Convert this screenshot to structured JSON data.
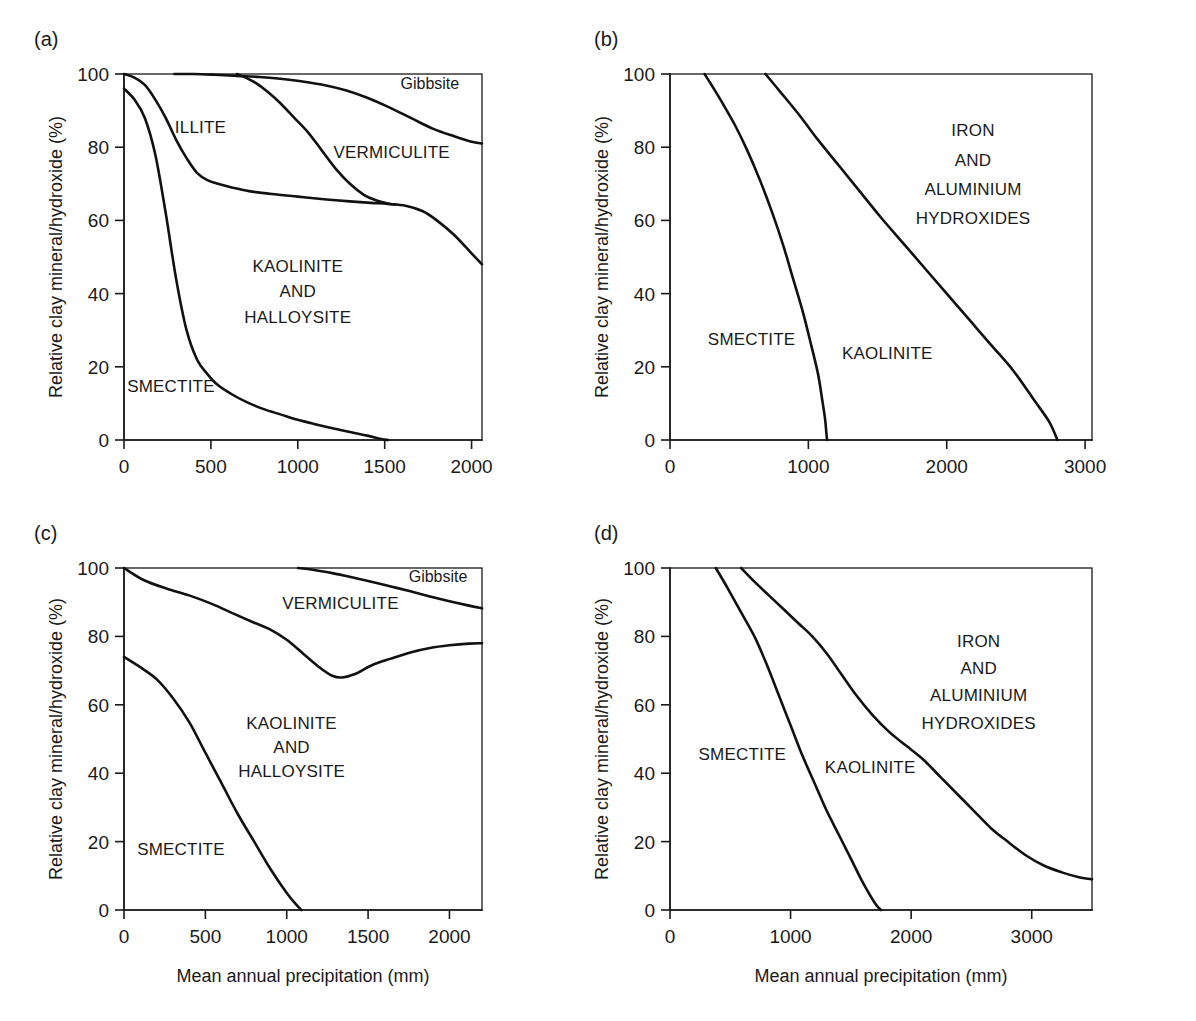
{
  "figure": {
    "y_axis_label": "Relative clay mineral/hydroxide (%)",
    "x_axis_label": "Mean annual precipitation (mm)"
  },
  "panels": [
    {
      "tag": "(a)",
      "name": "panel-a",
      "x_ticks": [
        0,
        500,
        1000,
        1500,
        2000
      ],
      "y_ticks": [
        0,
        20,
        40,
        60,
        80,
        100
      ],
      "xlim": [
        0,
        2060
      ],
      "ylim": [
        0,
        100
      ],
      "show_x_axis_title": false,
      "regions": [
        {
          "text": "ILLITE",
          "x": 440,
          "y": 84,
          "size": "normal"
        },
        {
          "text": "VERMICULITE",
          "x": 1540,
          "y": 77,
          "size": "normal"
        },
        {
          "text": "Gibbsite",
          "x": 1760,
          "y": 96,
          "size": "small"
        },
        {
          "text": "KAOLINITE",
          "x": 1000,
          "y": 46,
          "size": "normal"
        },
        {
          "text": "AND",
          "x": 1000,
          "y": 39,
          "size": "normal"
        },
        {
          "text": "HALLOYSITE",
          "x": 1000,
          "y": 32,
          "size": "normal"
        },
        {
          "text": "SMECTITE",
          "x": 270,
          "y": 13,
          "size": "normal"
        }
      ]
    },
    {
      "tag": "(b)",
      "name": "panel-b",
      "x_ticks": [
        0,
        1000,
        2000,
        3000
      ],
      "y_ticks": [
        0,
        20,
        40,
        60,
        80,
        100
      ],
      "xlim": [
        0,
        3050
      ],
      "ylim": [
        0,
        100
      ],
      "show_x_axis_title": false,
      "regions": [
        {
          "text": "IRON",
          "x": 2190,
          "y": 83,
          "size": "normal"
        },
        {
          "text": "AND",
          "x": 2190,
          "y": 75,
          "size": "normal"
        },
        {
          "text": "ALUMINIUM",
          "x": 2190,
          "y": 67,
          "size": "normal"
        },
        {
          "text": "HYDROXIDES",
          "x": 2190,
          "y": 59,
          "size": "normal"
        },
        {
          "text": "SMECTITE",
          "x": 590,
          "y": 26,
          "size": "normal"
        },
        {
          "text": "KAOLINITE",
          "x": 1570,
          "y": 22,
          "size": "normal"
        }
      ]
    },
    {
      "tag": "(c)",
      "name": "panel-c",
      "x_ticks": [
        0,
        500,
        1000,
        1500,
        2000
      ],
      "y_ticks": [
        0,
        20,
        40,
        60,
        80,
        100
      ],
      "xlim": [
        0,
        2200
      ],
      "ylim": [
        0,
        100
      ],
      "show_x_axis_title": true,
      "regions": [
        {
          "text": "VERMICULITE",
          "x": 1330,
          "y": 88,
          "size": "normal"
        },
        {
          "text": "Gibbsite",
          "x": 1930,
          "y": 96,
          "size": "small"
        },
        {
          "text": "KAOLINITE",
          "x": 1030,
          "y": 53,
          "size": "normal"
        },
        {
          "text": "AND",
          "x": 1030,
          "y": 46,
          "size": "normal"
        },
        {
          "text": "HALLOYSITE",
          "x": 1030,
          "y": 39,
          "size": "normal"
        },
        {
          "text": "SMECTITE",
          "x": 350,
          "y": 16,
          "size": "normal"
        }
      ]
    },
    {
      "tag": "(d)",
      "name": "panel-d",
      "x_ticks": [
        0,
        1000,
        2000,
        3000
      ],
      "y_ticks": [
        0,
        20,
        40,
        60,
        80,
        100
      ],
      "xlim": [
        0,
        3500
      ],
      "ylim": [
        0,
        100
      ],
      "show_x_axis_title": true,
      "regions": [
        {
          "text": "IRON",
          "x": 2560,
          "y": 77,
          "size": "normal"
        },
        {
          "text": "AND",
          "x": 2560,
          "y": 69,
          "size": "normal"
        },
        {
          "text": "ALUMINIUM",
          "x": 2560,
          "y": 61,
          "size": "normal"
        },
        {
          "text": "HYDROXIDES",
          "x": 2560,
          "y": 53,
          "size": "normal"
        },
        {
          "text": "SMECTITE",
          "x": 600,
          "y": 44,
          "size": "normal"
        },
        {
          "text": "KAOLINITE",
          "x": 1660,
          "y": 40,
          "size": "normal"
        }
      ]
    }
  ],
  "chart_data": [
    {
      "type": "line",
      "panel": "(a)",
      "title": "",
      "xlabel": "Mean annual precipitation (mm)",
      "ylabel": "Relative clay mineral/hydroxide (%)",
      "xlim": [
        0,
        2060
      ],
      "ylim": [
        0,
        100
      ],
      "grid": false,
      "legend": "in-plot region labels",
      "regions": [
        "SMECTITE",
        "ILLITE",
        "KAOLINITE AND HALLOYSITE",
        "VERMICULITE",
        "Gibbsite"
      ],
      "series": [
        {
          "name": "smectite-upper-boundary",
          "x": [
            0,
            60,
            120,
            180,
            240,
            300,
            360,
            420,
            480,
            540,
            620,
            700,
            800,
            900,
            1000,
            1100,
            1200,
            1300,
            1400,
            1480,
            1520
          ],
          "values": [
            96,
            93,
            88,
            78,
            62,
            44,
            30,
            22,
            18,
            15,
            12.5,
            10.5,
            8.5,
            7,
            5.5,
            4.3,
            3.2,
            2.2,
            1.2,
            0.3,
            0
          ]
        },
        {
          "name": "illite-upper-boundary",
          "x": [
            0,
            60,
            120,
            180,
            240,
            300,
            360,
            420,
            480,
            540,
            620,
            720,
            850,
            1000,
            1150,
            1300,
            1420,
            1520,
            1620,
            1720,
            1800,
            1900,
            2000,
            2060
          ],
          "values": [
            100,
            99,
            97,
            93,
            88,
            82,
            77,
            73,
            71,
            70,
            69,
            68,
            67.2,
            66.5,
            65.8,
            65.2,
            64.8,
            64.5,
            64,
            62.5,
            60,
            56,
            51,
            48
          ]
        },
        {
          "name": "vermiculite-lower-boundary",
          "x": [
            650,
            700,
            760,
            830,
            900,
            980,
            1060,
            1140,
            1220,
            1300,
            1380,
            1450,
            1520,
            1560
          ],
          "values": [
            100,
            99,
            97.5,
            95,
            92,
            88,
            84,
            79,
            74,
            70,
            67,
            65.5,
            64.6,
            64.3
          ]
        },
        {
          "name": "gibbsite-lower-boundary",
          "x": [
            290,
            400,
            520,
            650,
            780,
            900,
            1020,
            1150,
            1280,
            1400,
            1520,
            1650,
            1780,
            1900,
            2000,
            2060
          ],
          "values": [
            100,
            100,
            99.8,
            99.5,
            99.2,
            98.7,
            98,
            97,
            95.5,
            93.5,
            91,
            88,
            85,
            83,
            81.5,
            81
          ]
        }
      ]
    },
    {
      "type": "line",
      "panel": "(b)",
      "title": "",
      "xlabel": "Mean annual precipitation (mm)",
      "ylabel": "Relative clay mineral/hydroxide (%)",
      "xlim": [
        0,
        3050
      ],
      "ylim": [
        0,
        100
      ],
      "grid": false,
      "legend": "in-plot region labels",
      "regions": [
        "SMECTITE",
        "KAOLINITE",
        "IRON AND ALUMINIUM HYDROXIDES"
      ],
      "series": [
        {
          "name": "smectite-kaolinite-boundary",
          "x": [
            250,
            300,
            380,
            470,
            560,
            650,
            740,
            820,
            890,
            960,
            1020,
            1070,
            1100,
            1120,
            1130,
            1135
          ],
          "values": [
            100,
            97,
            92,
            86,
            79,
            71,
            62,
            53,
            44,
            35,
            26,
            18,
            11,
            6,
            2,
            0
          ]
        },
        {
          "name": "kaolinite-hydroxides-boundary",
          "x": [
            690,
            800,
            930,
            1070,
            1220,
            1370,
            1520,
            1680,
            1840,
            2000,
            2160,
            2320,
            2480,
            2630,
            2740,
            2800
          ],
          "values": [
            100,
            95,
            89,
            82,
            75,
            68,
            61,
            54,
            47,
            40,
            33,
            26,
            19,
            11,
            5,
            0
          ]
        }
      ]
    },
    {
      "type": "line",
      "panel": "(c)",
      "title": "",
      "xlabel": "Mean annual precipitation (mm)",
      "ylabel": "Relative clay mineral/hydroxide (%)",
      "xlim": [
        0,
        2200
      ],
      "ylim": [
        0,
        100
      ],
      "grid": false,
      "legend": "in-plot region labels",
      "regions": [
        "SMECTITE",
        "KAOLINITE AND HALLOYSITE",
        "VERMICULITE",
        "Gibbsite"
      ],
      "series": [
        {
          "name": "smectite-upper-boundary",
          "x": [
            0,
            100,
            200,
            300,
            400,
            500,
            600,
            700,
            800,
            900,
            1000,
            1060,
            1090
          ],
          "values": [
            74,
            71,
            67.5,
            62,
            55,
            46,
            37,
            28,
            20,
            12,
            5,
            1.5,
            0
          ]
        },
        {
          "name": "kaolinite-upper-boundary",
          "x": [
            0,
            120,
            260,
            400,
            540,
            680,
            800,
            900,
            1000,
            1100,
            1200,
            1280,
            1340,
            1420,
            1520,
            1640,
            1760,
            1880,
            2000,
            2120,
            2200
          ],
          "values": [
            100,
            96.5,
            94,
            92,
            89.5,
            86.5,
            84,
            82,
            79,
            75,
            71,
            68.5,
            68,
            69,
            71.5,
            73.5,
            75.3,
            76.6,
            77.4,
            77.9,
            78
          ]
        },
        {
          "name": "gibbsite-lower-boundary",
          "x": [
            1070,
            1160,
            1280,
            1400,
            1520,
            1640,
            1760,
            1880,
            2000,
            2120,
            2200
          ],
          "values": [
            100,
            99.5,
            98.5,
            97.3,
            96,
            94.6,
            93.2,
            91.7,
            90.3,
            89,
            88.2
          ]
        }
      ]
    },
    {
      "type": "line",
      "panel": "(d)",
      "title": "",
      "xlabel": "Mean annual precipitation (mm)",
      "ylabel": "Relative clay mineral/hydroxide (%)",
      "xlim": [
        0,
        3500
      ],
      "ylim": [
        0,
        100
      ],
      "grid": false,
      "legend": "in-plot region labels",
      "regions": [
        "SMECTITE",
        "KAOLINITE",
        "IRON AND ALUMINIUM HYDROXIDES"
      ],
      "series": [
        {
          "name": "smectite-kaolinite-boundary",
          "x": [
            380,
            480,
            590,
            700,
            800,
            900,
            1000,
            1100,
            1200,
            1300,
            1400,
            1500,
            1600,
            1700,
            1750
          ],
          "values": [
            100,
            94,
            87,
            80,
            72,
            63,
            54,
            45,
            37,
            29,
            22,
            15,
            8,
            2,
            0
          ]
        },
        {
          "name": "kaolinite-hydroxides-boundary",
          "x": [
            590,
            700,
            820,
            940,
            1060,
            1180,
            1300,
            1420,
            1540,
            1680,
            1820,
            1960,
            2100,
            2240,
            2380,
            2520,
            2660,
            2800,
            2950,
            3100,
            3250,
            3400,
            3500
          ],
          "values": [
            100,
            96,
            92,
            88,
            84,
            80,
            75,
            69,
            63,
            57,
            52,
            48,
            44,
            39,
            34,
            29,
            24,
            20,
            16,
            13,
            11,
            9.5,
            9
          ]
        }
      ]
    }
  ]
}
